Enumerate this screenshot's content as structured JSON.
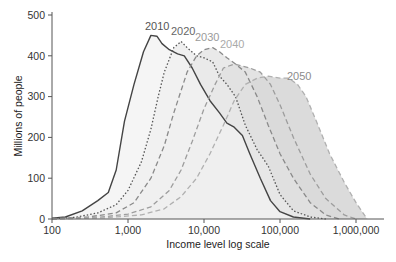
{
  "chart_data": {
    "type": "area",
    "title": "",
    "xlabel": "Income level log scale",
    "ylabel": "Millions of people",
    "xscale": "log",
    "xlim": [
      100,
      2000000
    ],
    "ylim": [
      0,
      500
    ],
    "x_ticks": [
      100,
      1000,
      10000,
      100000,
      1000000
    ],
    "x_tick_labels": [
      "100",
      "1,000",
      "10,000",
      "100,000",
      "1,000,000"
    ],
    "y_ticks": [
      0,
      100,
      200,
      300,
      400,
      500
    ],
    "y_tick_labels": [
      "0",
      "100",
      "200",
      "300",
      "400",
      "500"
    ],
    "grid": false,
    "legend": "inline labels near curve peaks",
    "series": [
      {
        "name": "2010",
        "style": "solid",
        "color": "#444444",
        "fill": "#f2f2f2",
        "x": [
          100,
          150,
          250,
          400,
          550,
          700,
          900,
          1200,
          1600,
          2000,
          2400,
          2800,
          3500,
          4500,
          5500,
          7000,
          9000,
          12000,
          16000,
          20000,
          25000,
          32000,
          40000,
          55000,
          75000,
          100000,
          150000,
          250000
        ],
        "y": [
          2,
          5,
          20,
          45,
          65,
          120,
          240,
          330,
          410,
          450,
          448,
          430,
          415,
          405,
          400,
          370,
          330,
          290,
          260,
          235,
          225,
          205,
          160,
          100,
          45,
          18,
          5,
          0
        ]
      },
      {
        "name": "2020",
        "style": "dotted",
        "color": "#555555",
        "fill": "#e9e9e9",
        "x": [
          100,
          200,
          400,
          700,
          1000,
          1500,
          2000,
          2500,
          3000,
          4000,
          5000,
          6000,
          8000,
          10000,
          13000,
          16000,
          20000,
          26000,
          35000,
          50000,
          70000,
          100000,
          150000,
          250000,
          400000
        ],
        "y": [
          1,
          4,
          15,
          35,
          70,
          140,
          220,
          300,
          360,
          420,
          435,
          420,
          400,
          395,
          385,
          350,
          330,
          300,
          230,
          170,
          130,
          60,
          20,
          5,
          0
        ]
      },
      {
        "name": "2030",
        "style": "dashed",
        "color": "#8a8a8a",
        "fill": "#e2e2e2",
        "x": [
          100,
          300,
          700,
          1200,
          2000,
          3000,
          4000,
          6000,
          8000,
          10000,
          13000,
          16000,
          20000,
          26000,
          35000,
          50000,
          70000,
          100000,
          150000,
          250000,
          400000,
          600000
        ],
        "y": [
          1,
          5,
          15,
          40,
          100,
          180,
          260,
          360,
          400,
          415,
          420,
          410,
          395,
          380,
          360,
          300,
          230,
          160,
          100,
          40,
          10,
          0
        ]
      },
      {
        "name": "2040",
        "style": "dashed",
        "color": "#9d9d9d",
        "fill": "#dadada",
        "x": [
          100,
          400,
          1000,
          2000,
          3500,
          5000,
          7000,
          10000,
          14000,
          18000,
          25000,
          32000,
          40000,
          55000,
          75000,
          100000,
          150000,
          250000,
          400000,
          700000,
          1000000
        ],
        "y": [
          0,
          4,
          12,
          30,
          70,
          120,
          190,
          270,
          330,
          370,
          380,
          375,
          370,
          360,
          330,
          280,
          200,
          110,
          50,
          10,
          0
        ]
      },
      {
        "name": "2050",
        "style": "dashed",
        "color": "#b0b0b0",
        "fill": "#cfcfcf",
        "x": [
          100,
          500,
          1500,
          3000,
          5000,
          8000,
          12000,
          18000,
          25000,
          35000,
          50000,
          70000,
          100000,
          130000,
          170000,
          220000,
          300000,
          450000,
          700000,
          1000000,
          1400000
        ],
        "y": [
          0,
          3,
          10,
          25,
          55,
          100,
          160,
          230,
          290,
          330,
          345,
          350,
          345,
          345,
          330,
          300,
          240,
          160,
          90,
          40,
          0
        ]
      }
    ]
  },
  "axes": {
    "xlabel": "Income level log scale",
    "ylabel": "Millions of people",
    "x_tick_labels": [
      "100",
      "1,000",
      "10,000",
      "100,000",
      "1,000,000"
    ],
    "y_tick_labels": [
      "0",
      "100",
      "200",
      "300",
      "400",
      "500"
    ]
  },
  "labels": {
    "s2010": "2010",
    "s2020": "2020",
    "s2030": "2030",
    "s2040": "2040",
    "s2050": "2050"
  }
}
